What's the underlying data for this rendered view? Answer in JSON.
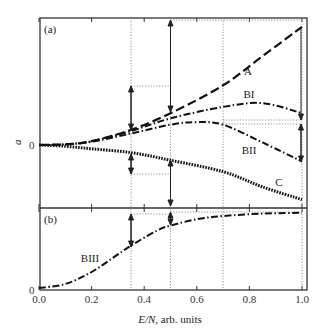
{
  "chart_data": {
    "type": "line",
    "title": "",
    "xlabel_italic": "E/N,",
    "xlabel_rest": " arb. units",
    "ylabel": "a",
    "xlim": [
      0.0,
      1.0
    ],
    "xticks": [
      "0.0",
      "0.2",
      "0.4",
      "0.6",
      "0.8",
      "1.0"
    ],
    "x_tick_values": [
      0.0,
      0.2,
      0.4,
      0.6,
      0.8,
      1.0
    ],
    "reference_lines_x": [
      0.35,
      0.5,
      0.7,
      1.0
    ],
    "panels": [
      {
        "label": "(a)",
        "zero_label": "0",
        "series": [
          {
            "name": "A",
            "style": "dashed",
            "x": [
              0.0,
              0.1,
              0.2,
              0.35,
              0.5,
              0.7,
              0.85,
              1.0
            ],
            "y": [
              0.0,
              0.005,
              0.03,
              0.12,
              0.25,
              0.47,
              0.7,
              0.93
            ]
          },
          {
            "name": "BI",
            "style": "dash-dot",
            "x": [
              0.0,
              0.1,
              0.2,
              0.35,
              0.5,
              0.7,
              0.85,
              1.0
            ],
            "y": [
              0.0,
              0.005,
              0.03,
              0.11,
              0.21,
              0.3,
              0.33,
              0.25
            ]
          },
          {
            "name": "BII",
            "style": "dash-dot",
            "x": [
              0.0,
              0.1,
              0.2,
              0.35,
              0.5,
              0.6,
              0.7,
              0.85,
              1.0
            ],
            "y": [
              0.0,
              0.005,
              0.025,
              0.09,
              0.16,
              0.18,
              0.16,
              0.02,
              -0.13
            ]
          },
          {
            "name": "C",
            "style": "dotted",
            "x": [
              0.0,
              0.1,
              0.2,
              0.35,
              0.5,
              0.7,
              0.85,
              1.0
            ],
            "y": [
              0.0,
              -0.01,
              -0.03,
              -0.06,
              -0.12,
              -0.21,
              -0.33,
              -0.43
            ]
          }
        ]
      },
      {
        "label": "(b)",
        "zero_label": "0",
        "series": [
          {
            "name": "BIII",
            "style": "dash-dot",
            "x": [
              0.0,
              0.1,
              0.2,
              0.3,
              0.35,
              0.45,
              0.5,
              0.6,
              0.7,
              0.85,
              1.0
            ],
            "y": [
              0.0,
              0.05,
              0.2,
              0.42,
              0.53,
              0.72,
              0.78,
              0.86,
              0.9,
              0.93,
              0.94
            ]
          }
        ]
      }
    ],
    "annotations": [
      {
        "type": "arrow",
        "x": 0.35,
        "desc": "double arrow between A/BI level and C level"
      },
      {
        "type": "arrow",
        "x": 0.5,
        "desc": "double arrow spanning A level to C level"
      },
      {
        "type": "arrow",
        "x": 1.0,
        "desc": "double arrow spanning A top to BII and C"
      }
    ]
  }
}
